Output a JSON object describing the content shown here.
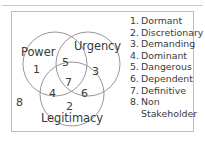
{
  "figure": {
    "type": "venn-diagram",
    "circles": [
      {
        "id": "power",
        "label": "Power"
      },
      {
        "id": "urgency",
        "label": "Urgency"
      },
      {
        "id": "legitimacy",
        "label": "Legitimacy"
      }
    ],
    "regions": [
      {
        "id": "power-only",
        "number": "1"
      },
      {
        "id": "legitimacy-only",
        "number": "2"
      },
      {
        "id": "urgency-only",
        "number": "3"
      },
      {
        "id": "power-legitimacy",
        "number": "4"
      },
      {
        "id": "power-urgency",
        "number": "5"
      },
      {
        "id": "urgency-legitimacy",
        "number": "6"
      },
      {
        "id": "all-three",
        "number": "7"
      },
      {
        "id": "outside-all",
        "number": "8"
      }
    ]
  },
  "legend": {
    "items": [
      {
        "num": "1.",
        "text": "Dormant"
      },
      {
        "num": "2.",
        "text": "Discretionary"
      },
      {
        "num": "3.",
        "text": "Demanding"
      },
      {
        "num": "4.",
        "text": "Dominant"
      },
      {
        "num": "5.",
        "text": "Dangerous"
      },
      {
        "num": "6.",
        "text": "Dependent"
      },
      {
        "num": "7.",
        "text": "Definitive"
      },
      {
        "num": "8.",
        "text": "Non"
      }
    ],
    "continuation": "Stakeholder"
  },
  "colors": {
    "stroke": "#8a8a8a",
    "text": "#3a3a3a",
    "frame": "#bdbdbd",
    "rule": "#c9c9c9",
    "background": "#ffffff"
  }
}
